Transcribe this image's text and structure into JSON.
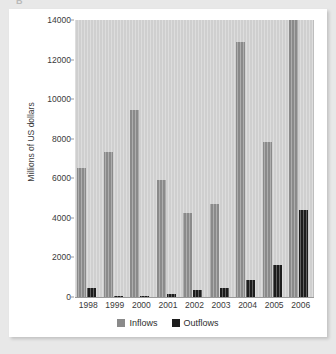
{
  "figure": {
    "label": "B"
  },
  "chart_data": {
    "type": "bar",
    "title": "",
    "subtitle": "",
    "xlabel": "",
    "ylabel": "Millions of US dollars",
    "ylim": [
      0,
      14000
    ],
    "yticks": [
      0,
      2000,
      4000,
      6000,
      8000,
      10000,
      12000,
      14000
    ],
    "ytick_labels": [
      "0",
      "2000",
      "4000",
      "6000",
      "8000",
      "10000",
      "12000",
      "14000"
    ],
    "grid": false,
    "legend_position": "bottom",
    "categories": [
      "1998",
      "1999",
      "2000",
      "2001",
      "2002",
      "2003",
      "2004",
      "2005",
      "2006"
    ],
    "series": [
      {
        "name": "Inflows",
        "color": "#8a8a8a",
        "values": [
          6500,
          7350,
          9450,
          5900,
          4250,
          4700,
          12900,
          7850,
          14000
        ]
      },
      {
        "name": "Outflows",
        "color": "#1d1d1d",
        "values": [
          450,
          50,
          30,
          150,
          350,
          480,
          870,
          1620,
          4400
        ]
      }
    ]
  },
  "colors": {
    "page_background": "#e8e8e8",
    "card_background": "#ffffff",
    "plot_background": "#cfcfcf",
    "inflows": "#8a8a8a",
    "outflows": "#1d1d1d",
    "axis_text": "#3a3a3a"
  }
}
